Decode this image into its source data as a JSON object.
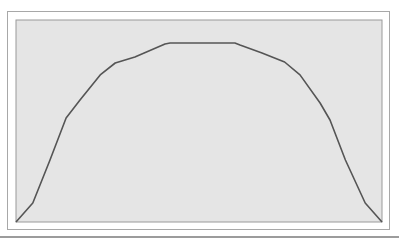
{
  "chart_data": {
    "type": "line",
    "title": "",
    "xlabel": "",
    "ylabel": "",
    "xlim": [
      0,
      1
    ],
    "ylim": [
      0,
      1
    ],
    "grid": false,
    "legend": "none",
    "x_ticks": [],
    "y_ticks": [],
    "series": [
      {
        "name": "curve",
        "color": "#555555",
        "x": [
          0.0,
          0.046,
          0.093,
          0.137,
          0.175,
          0.23,
          0.271,
          0.325,
          0.407,
          0.421,
          0.598,
          0.612,
          0.672,
          0.734,
          0.776,
          0.831,
          0.858,
          0.9,
          0.954,
          1.0
        ],
        "y": [
          0.0,
          0.094,
          0.307,
          0.515,
          0.604,
          0.728,
          0.787,
          0.817,
          0.881,
          0.886,
          0.886,
          0.876,
          0.837,
          0.792,
          0.728,
          0.589,
          0.505,
          0.307,
          0.094,
          0.0
        ]
      }
    ],
    "plot_background": "#e5e5e5",
    "frame_color": "#a8a8a8"
  }
}
